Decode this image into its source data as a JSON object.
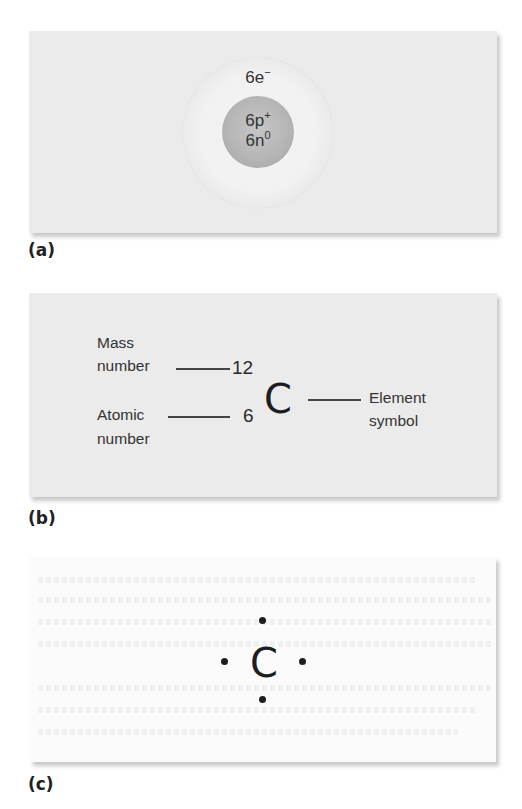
{
  "figure": {
    "panels": [
      {
        "id": "a",
        "label": "(a)",
        "type": "atom-model",
        "electron_shell": {
          "count": "6e",
          "charge": "−"
        },
        "nucleus": {
          "protons": {
            "count": "6p",
            "charge": "+"
          },
          "neutrons": {
            "count": "6n",
            "charge": "0"
          }
        },
        "colors": {
          "background": "#ebebeb",
          "cloud": "#f1f1f1",
          "nucleus": "#b6b6b6"
        }
      },
      {
        "id": "b",
        "label": "(b)",
        "type": "isotope-notation",
        "mass_number_label_line1": "Mass",
        "mass_number_label_line2": "number",
        "mass_number": "12",
        "atomic_number_label_line1": "Atomic",
        "atomic_number_label_line2": "number",
        "atomic_number": "6",
        "element_symbol": "C",
        "element_symbol_label_line1": "Element",
        "element_symbol_label_line2": "symbol",
        "colors": {
          "background": "#ebebeb"
        }
      },
      {
        "id": "c",
        "label": "(c)",
        "type": "lewis-dot-structure",
        "element_symbol": "C",
        "valence_dots": [
          "top",
          "left",
          "right",
          "bottom"
        ],
        "colors": {
          "background": "#fbfbfb"
        }
      }
    ]
  }
}
